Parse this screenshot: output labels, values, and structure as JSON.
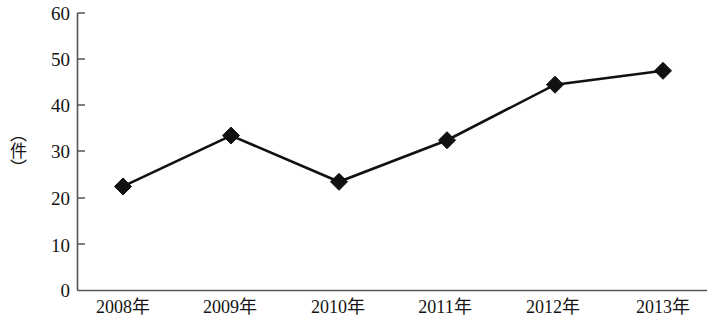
{
  "chart_data": {
    "type": "line",
    "title": "",
    "subtitle": "",
    "xlabel": "",
    "ylabel": "（件）",
    "categories": [
      "2008年",
      "2009年",
      "2010年",
      "2011年",
      "2012年",
      "2013年"
    ],
    "values": [
      22.5,
      33.5,
      23.5,
      32.5,
      44.5,
      47.5
    ],
    "series": [
      {
        "name": "",
        "values": [
          22.5,
          33.5,
          23.5,
          32.5,
          44.5,
          47.5
        ]
      }
    ],
    "ylim": [
      0,
      60
    ],
    "y_ticks": [
      0,
      10,
      20,
      30,
      40,
      50,
      60
    ],
    "y_tick_labels": [
      "0",
      "10",
      "20",
      "30",
      "40",
      "50",
      "60"
    ],
    "x_tick_labels": [
      "2008年",
      "2009年",
      "2010年",
      "2011年",
      "2012年",
      "2013年"
    ],
    "grid": false,
    "legend": false,
    "legend_position": "none",
    "marker": "diamond",
    "line_color": "#111111",
    "marker_color": "#111111",
    "axis_color": "#555555",
    "background_color": "#ffffff",
    "annotations": []
  },
  "axes": {
    "y_label_text": "（件）",
    "y_ticks": [
      {
        "label": "60",
        "value": 60
      },
      {
        "label": "50",
        "value": 50
      },
      {
        "label": "40",
        "value": 40
      },
      {
        "label": "30",
        "value": 30
      },
      {
        "label": "20",
        "value": 20
      },
      {
        "label": "10",
        "value": 10
      },
      {
        "label": "0",
        "value": 0
      }
    ],
    "x_ticks": [
      {
        "label": "2008年"
      },
      {
        "label": "2009年"
      },
      {
        "label": "2010年"
      },
      {
        "label": "2011年"
      },
      {
        "label": "2012年"
      },
      {
        "label": "2013年"
      }
    ]
  }
}
